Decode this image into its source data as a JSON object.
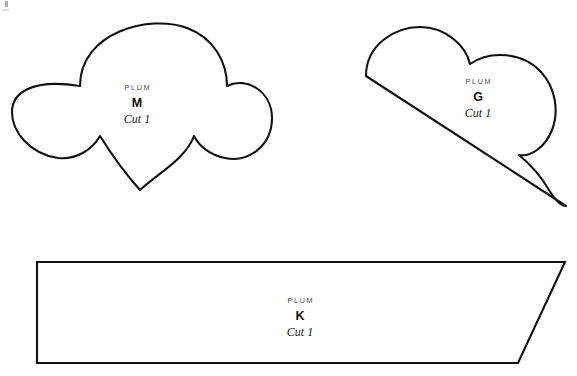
{
  "sheet": {
    "title": "Pattern Template Sheet",
    "background_color": "#ffffff",
    "outline_color": "#111111",
    "outline_width": 2.1,
    "width": 577,
    "height": 376
  },
  "corner_mark": {
    "name": "registration-mark",
    "color": "#8d8d8d"
  },
  "pieces": [
    {
      "id": "M",
      "collection": "PLUM",
      "letter": "M",
      "cut": "Cut 1",
      "shape": "cloud-scallop",
      "label_x": 137,
      "label_y": 84,
      "bounds": {
        "x": 10,
        "y": 18,
        "width": 264,
        "height": 187
      }
    },
    {
      "id": "G",
      "collection": "PLUM",
      "letter": "G",
      "cut": "Cut 1",
      "shape": "cloud-wedge",
      "label_x": 478,
      "label_y": 78,
      "bounds": {
        "x": 364,
        "y": 26,
        "width": 203,
        "height": 181
      }
    },
    {
      "id": "K",
      "collection": "PLUM",
      "letter": "K",
      "cut": "Cut 1",
      "shape": "slanted-quadrilateral",
      "label_x": 300,
      "label_y": 297,
      "bounds": {
        "x": 36,
        "y": 261,
        "width": 530,
        "height": 103
      }
    }
  ]
}
